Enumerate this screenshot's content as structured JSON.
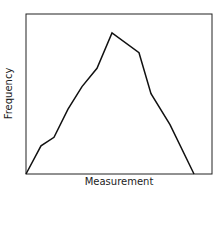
{
  "chart_data": {
    "type": "line",
    "title": "",
    "xlabel": "Measurement",
    "ylabel": "Frequency",
    "grid": false,
    "x": [
      0,
      1,
      2,
      3,
      4,
      5,
      6,
      7,
      8,
      9,
      10
    ],
    "values": [
      0,
      20,
      26,
      46,
      62,
      75,
      100,
      86,
      57,
      35,
      0
    ],
    "ylim": [
      0,
      115
    ]
  }
}
